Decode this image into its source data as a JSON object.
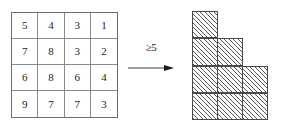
{
  "figure": {
    "matrix": {
      "rows": 4,
      "cols": 4,
      "values": [
        [
          5,
          4,
          3,
          1
        ],
        [
          7,
          8,
          3,
          2
        ],
        [
          6,
          8,
          6,
          4
        ],
        [
          9,
          7,
          7,
          3
        ]
      ]
    },
    "operator": {
      "label": "≥5",
      "arrow_icon": "right-arrow-icon"
    },
    "young_diagram": {
      "row_lengths": [
        1,
        2,
        3,
        3
      ],
      "fill": "diagonal-hatch"
    },
    "colors": {
      "grid_line": "#8a8a8a",
      "grid_border": "#6e6e6e",
      "cell_border": "#4a4a4a",
      "hatch": "#5a5a5a",
      "text": "#1b1b1b",
      "background": "#ffffff"
    }
  }
}
